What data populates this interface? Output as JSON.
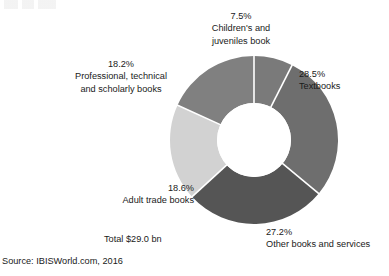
{
  "chart_data": {
    "type": "pie",
    "variant": "donut",
    "title": "",
    "subtitle": "",
    "xlabel": "",
    "ylabel": "",
    "grid": false,
    "legend_position": "callout-labels",
    "units": "percent",
    "total_label": "Total $29.0 bn",
    "total_value": 29.0,
    "total_units": "USD billions",
    "source": "Source: IBISWorld.com, 2016",
    "start_angle_deg": 0,
    "direction": "clockwise",
    "inner_radius_ratio": 0.44,
    "categories": [
      "Children's and juveniles book",
      "Textbooks",
      "Other books and services",
      "Adult trade books",
      "Professional, technical and scholarly books"
    ],
    "values": [
      7.5,
      28.5,
      27.2,
      18.6,
      18.2
    ],
    "slices": [
      {
        "label": "Children's and juveniles book",
        "label_line1": "Children's and",
        "label_line2": "juveniles book",
        "percent_text": "7.5%",
        "value": 7.5,
        "color": "#7a7a7a"
      },
      {
        "label": "Textbooks",
        "label_line1": "Textbooks",
        "label_line2": "",
        "percent_text": "28.5%",
        "value": 28.5,
        "color": "#6e6e6e"
      },
      {
        "label": "Other books and services",
        "label_line1": "Other books and services",
        "label_line2": "",
        "percent_text": "27.2%",
        "value": 27.2,
        "color": "#555555"
      },
      {
        "label": "Adult trade books",
        "label_line1": "Adult trade books",
        "label_line2": "",
        "percent_text": "18.6%",
        "value": 18.6,
        "color": "#d2d2d2"
      },
      {
        "label": "Professional, technical and scholarly books",
        "label_line1": "Professional, technical",
        "label_line2": "and scholarly books",
        "percent_text": "18.2%",
        "value": 18.2,
        "color": "#808080"
      }
    ]
  },
  "callouts": {
    "top": {
      "pct": "7.5%",
      "line1": "Children's and",
      "line2": "juveniles book"
    },
    "left": {
      "pct": "18.2%",
      "line1": "Professional, technical",
      "line2": "and scholarly books"
    },
    "right": {
      "pct": "28.5%",
      "line1": "Textbooks"
    },
    "bottom_right": {
      "pct": "27.2%",
      "line1": "Other books and services"
    },
    "bottom_left": {
      "pct": "18.6%",
      "line1": "Adult trade books"
    }
  },
  "footer": {
    "total": "Total $29.0 bn",
    "source": "Source: IBISWorld.com, 2016"
  },
  "colors": {
    "background": "#ffffff",
    "text": "#1a1a1a",
    "divider": "#ffffff",
    "slice_children": "#7a7a7a",
    "slice_textbooks": "#6e6e6e",
    "slice_other": "#555555",
    "slice_adult_trade": "#d2d2d2",
    "slice_professional": "#808080"
  }
}
